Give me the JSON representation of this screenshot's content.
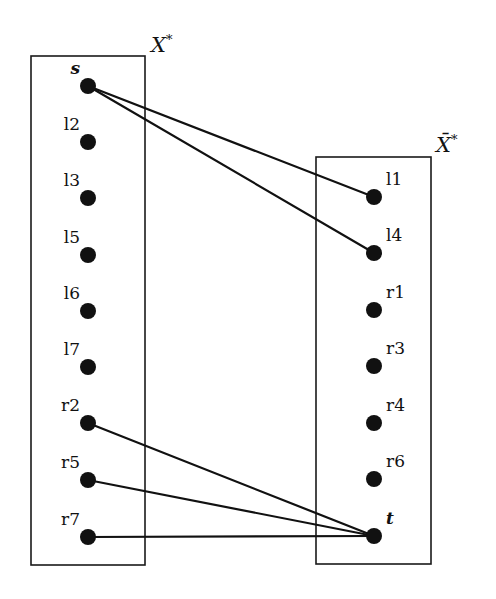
{
  "diagram": {
    "left_set": {
      "label": "X",
      "superscript": "*",
      "box": {
        "x": 31,
        "y": 56,
        "w": 114,
        "h": 509
      },
      "nodes": [
        {
          "id": "s",
          "label": "s",
          "italic": true,
          "x": 88,
          "y": 86
        },
        {
          "id": "l2",
          "label": "l2",
          "x": 88,
          "y": 142
        },
        {
          "id": "l3",
          "label": "l3",
          "x": 88,
          "y": 198
        },
        {
          "id": "l5",
          "label": "l5",
          "x": 88,
          "y": 255
        },
        {
          "id": "l6",
          "label": "l6",
          "x": 88,
          "y": 311
        },
        {
          "id": "l7",
          "label": "l7",
          "x": 88,
          "y": 367
        },
        {
          "id": "r2",
          "label": "r2",
          "x": 88,
          "y": 423
        },
        {
          "id": "r5",
          "label": "r5",
          "x": 88,
          "y": 480
        },
        {
          "id": "r7",
          "label": "r7",
          "x": 88,
          "y": 537
        }
      ]
    },
    "right_set": {
      "label": "X̄",
      "superscript": "*",
      "box": {
        "x": 316,
        "y": 157,
        "w": 115,
        "h": 407
      },
      "nodes": [
        {
          "id": "l1",
          "label": "l1",
          "x": 374,
          "y": 197
        },
        {
          "id": "l4",
          "label": "l4",
          "x": 374,
          "y": 253
        },
        {
          "id": "r1",
          "label": "r1",
          "x": 374,
          "y": 310
        },
        {
          "id": "r3",
          "label": "r3",
          "x": 374,
          "y": 366
        },
        {
          "id": "r4",
          "label": "r4",
          "x": 374,
          "y": 423
        },
        {
          "id": "r6",
          "label": "r6",
          "x": 374,
          "y": 479
        },
        {
          "id": "t",
          "label": "t",
          "italic": true,
          "x": 374,
          "y": 536
        }
      ]
    },
    "edges": [
      {
        "from": "s",
        "to": "l1"
      },
      {
        "from": "s",
        "to": "l4"
      },
      {
        "from": "r2",
        "to": "t"
      },
      {
        "from": "r5",
        "to": "t"
      },
      {
        "from": "r7",
        "to": "t"
      }
    ]
  }
}
